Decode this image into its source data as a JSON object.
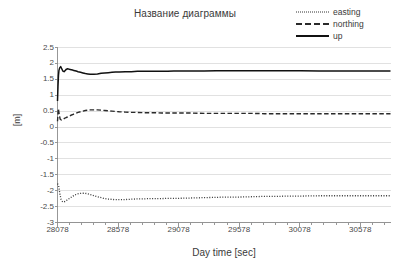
{
  "chart_data": {
    "type": "line",
    "title": "Название диаграммы",
    "xlabel": "Day time [sec]",
    "ylabel": "[m]",
    "xlim": [
      28078,
      30828
    ],
    "ylim": [
      -3,
      2.5
    ],
    "ytick_labels": [
      "2.5",
      "2",
      "1.5",
      "1",
      "0.5",
      "0",
      "-0.5",
      "-1",
      "-1.5",
      "-2",
      "-2.5",
      "-3"
    ],
    "ytick_values": [
      2.5,
      2,
      1.5,
      1,
      0.5,
      0,
      -0.5,
      -1,
      -1.5,
      -2,
      -2.5,
      -3
    ],
    "xtick_labels": [
      "28078",
      "28578",
      "29078",
      "29578",
      "30078",
      "30578"
    ],
    "xtick_values": [
      28078,
      28578,
      29078,
      29578,
      30078,
      30578
    ],
    "xminor_step": 100,
    "grid": "horizontal",
    "legend_position": "top-right",
    "legend": [
      "easting",
      "northing",
      "up"
    ],
    "series": [
      {
        "name": "easting",
        "style": "dotted",
        "color": "#333333",
        "x": [
          28078,
          28088,
          28098,
          28108,
          28118,
          28128,
          28143,
          28158,
          28178,
          28198,
          28218,
          28238,
          28258,
          28278,
          28298,
          28318,
          28338,
          28358,
          28378,
          28398,
          28428,
          28458,
          28488,
          28518,
          28548,
          28578,
          28628,
          28678,
          28728,
          28778,
          28828,
          28878,
          28928,
          28978,
          29028,
          29078,
          29178,
          29278,
          29378,
          29478,
          29578,
          29678,
          29778,
          29878,
          29978,
          30078,
          30228,
          30378,
          30528,
          30678,
          30828
        ],
        "y": [
          -1.78,
          -1.85,
          -2.12,
          -2.28,
          -2.34,
          -2.36,
          -2.33,
          -2.29,
          -2.24,
          -2.19,
          -2.14,
          -2.11,
          -2.09,
          -2.08,
          -2.08,
          -2.09,
          -2.11,
          -2.13,
          -2.16,
          -2.18,
          -2.21,
          -2.24,
          -2.26,
          -2.27,
          -2.28,
          -2.28,
          -2.28,
          -2.27,
          -2.26,
          -2.26,
          -2.25,
          -2.25,
          -2.25,
          -2.24,
          -2.24,
          -2.24,
          -2.23,
          -2.22,
          -2.21,
          -2.2,
          -2.2,
          -2.19,
          -2.18,
          -2.18,
          -2.17,
          -2.17,
          -2.16,
          -2.16,
          -2.16,
          -2.16,
          -2.16
        ]
      },
      {
        "name": "northing",
        "style": "dashed",
        "color": "#2a2a2a",
        "x": [
          28078,
          28085,
          28092,
          28100,
          28110,
          28122,
          28135,
          28150,
          28168,
          28188,
          28208,
          28228,
          28248,
          28268,
          28288,
          28308,
          28328,
          28348,
          28378,
          28408,
          28438,
          28468,
          28498,
          28528,
          28558,
          28588,
          28638,
          28688,
          28738,
          28788,
          28838,
          28888,
          28938,
          28988,
          29038,
          29088,
          29188,
          29288,
          29388,
          29488,
          29588,
          29688,
          29788,
          29888,
          29988,
          30088,
          30238,
          30388,
          30538,
          30688,
          30828
        ],
        "y": [
          0.18,
          0.58,
          0.4,
          0.25,
          0.22,
          0.24,
          0.27,
          0.3,
          0.33,
          0.37,
          0.4,
          0.43,
          0.46,
          0.48,
          0.5,
          0.52,
          0.53,
          0.54,
          0.54,
          0.54,
          0.53,
          0.52,
          0.51,
          0.5,
          0.49,
          0.48,
          0.47,
          0.46,
          0.46,
          0.45,
          0.45,
          0.45,
          0.44,
          0.44,
          0.44,
          0.44,
          0.44,
          0.43,
          0.43,
          0.43,
          0.43,
          0.43,
          0.42,
          0.42,
          0.42,
          0.42,
          0.42,
          0.42,
          0.42,
          0.42,
          0.42
        ]
      },
      {
        "name": "up",
        "style": "solid",
        "color": "#111111",
        "x": [
          28078,
          28082,
          28086,
          28090,
          28096,
          28104,
          28112,
          28122,
          28132,
          28142,
          28152,
          28162,
          28172,
          28182,
          28192,
          28202,
          28212,
          28222,
          28232,
          28248,
          28268,
          28288,
          28308,
          28328,
          28348,
          28378,
          28408,
          28438,
          28468,
          28498,
          28528,
          28558,
          28588,
          28638,
          28688,
          28738,
          28788,
          28838,
          28888,
          28938,
          28988,
          29038,
          29088,
          29188,
          29288,
          29388,
          29488,
          29588,
          29688,
          29788,
          29888,
          29988,
          30088,
          30238,
          30388,
          30538,
          30688,
          30828
        ],
        "y": [
          0.82,
          1.28,
          1.62,
          1.78,
          1.86,
          1.9,
          1.84,
          1.76,
          1.74,
          1.78,
          1.82,
          1.83,
          1.82,
          1.81,
          1.8,
          1.79,
          1.78,
          1.77,
          1.76,
          1.74,
          1.72,
          1.7,
          1.68,
          1.67,
          1.66,
          1.66,
          1.67,
          1.69,
          1.7,
          1.71,
          1.72,
          1.73,
          1.73,
          1.74,
          1.74,
          1.75,
          1.75,
          1.75,
          1.75,
          1.75,
          1.75,
          1.76,
          1.76,
          1.76,
          1.76,
          1.77,
          1.77,
          1.77,
          1.77,
          1.77,
          1.77,
          1.77,
          1.77,
          1.76,
          1.76,
          1.76,
          1.76,
          1.76
        ]
      }
    ]
  },
  "colors": {
    "grid": "#d9d9d9",
    "axis": "#8c8c8c",
    "text": "#3a3a3a",
    "background": "#ffffff"
  }
}
